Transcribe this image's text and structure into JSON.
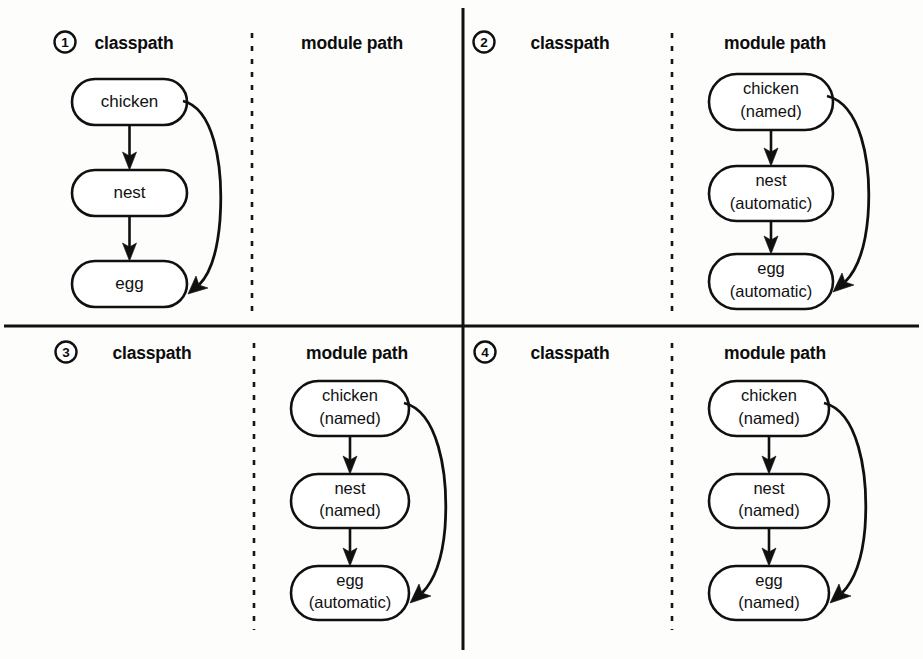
{
  "figure": {
    "column_headers": {
      "classpath": "classpath",
      "module_path": "module path"
    },
    "quadrants": [
      {
        "number": "1",
        "badge_icon": "circled-number-icon",
        "classpath_header": "classpath",
        "module_path_header": "module path",
        "populated_column": "classpath",
        "nodes": [
          {
            "name": "chicken",
            "line1": "chicken",
            "line2": ""
          },
          {
            "name": "nest",
            "line1": "nest",
            "line2": ""
          },
          {
            "name": "egg",
            "line1": "egg",
            "line2": ""
          }
        ],
        "edges": [
          {
            "from": "chicken",
            "to": "nest",
            "style": "straight-arrow"
          },
          {
            "from": "nest",
            "to": "egg",
            "style": "straight-arrow"
          },
          {
            "from": "chicken",
            "to": "egg",
            "style": "curved-arrow"
          }
        ]
      },
      {
        "number": "2",
        "badge_icon": "circled-number-icon",
        "classpath_header": "classpath",
        "module_path_header": "module path",
        "populated_column": "module path",
        "nodes": [
          {
            "name": "chicken",
            "line1": "chicken",
            "line2": "(named)"
          },
          {
            "name": "nest",
            "line1": "nest",
            "line2": "(automatic)"
          },
          {
            "name": "egg",
            "line1": "egg",
            "line2": "(automatic)"
          }
        ],
        "edges": [
          {
            "from": "chicken",
            "to": "nest",
            "style": "straight-arrow"
          },
          {
            "from": "nest",
            "to": "egg",
            "style": "straight-arrow"
          },
          {
            "from": "chicken",
            "to": "egg",
            "style": "curved-arrow"
          }
        ]
      },
      {
        "number": "3",
        "badge_icon": "circled-number-icon",
        "classpath_header": "classpath",
        "module_path_header": "module path",
        "populated_column": "module path",
        "nodes": [
          {
            "name": "chicken",
            "line1": "chicken",
            "line2": "(named)"
          },
          {
            "name": "nest",
            "line1": "nest",
            "line2": "(named)"
          },
          {
            "name": "egg",
            "line1": "egg",
            "line2": "(automatic)"
          }
        ],
        "edges": [
          {
            "from": "chicken",
            "to": "nest",
            "style": "straight-arrow"
          },
          {
            "from": "nest",
            "to": "egg",
            "style": "straight-arrow"
          },
          {
            "from": "chicken",
            "to": "egg",
            "style": "curved-arrow"
          }
        ]
      },
      {
        "number": "4",
        "badge_icon": "circled-number-icon",
        "classpath_header": "classpath",
        "module_path_header": "module path",
        "populated_column": "module path",
        "nodes": [
          {
            "name": "chicken",
            "line1": "chicken",
            "line2": "(named)"
          },
          {
            "name": "nest",
            "line1": "nest",
            "line2": "(named)"
          },
          {
            "name": "egg",
            "line1": "egg",
            "line2": "(named)"
          }
        ],
        "edges": [
          {
            "from": "chicken",
            "to": "nest",
            "style": "straight-arrow"
          },
          {
            "from": "nest",
            "to": "egg",
            "style": "straight-arrow"
          },
          {
            "from": "chicken",
            "to": "egg",
            "style": "curved-arrow"
          }
        ]
      }
    ],
    "colors": {
      "stroke": "#101010",
      "fill": "#ffffff",
      "background": "#fdfdfc"
    }
  }
}
